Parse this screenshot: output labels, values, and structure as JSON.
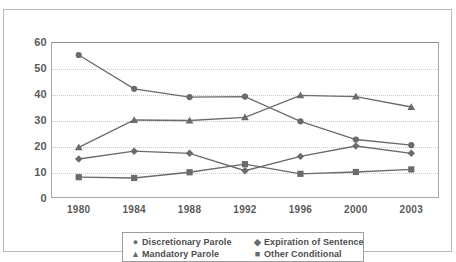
{
  "title_strip": "",
  "chart_data": {
    "type": "line",
    "title": "",
    "xlabel": "",
    "ylabel": "",
    "categories": [
      "1980",
      "1984",
      "1988",
      "1992",
      "1996",
      "2000",
      "2003"
    ],
    "ylim": [
      0,
      60
    ],
    "yticks": [
      0,
      10,
      20,
      30,
      40,
      50,
      60
    ],
    "grid": true,
    "legend_position": "bottom",
    "series": [
      {
        "name": "Discretionary Parole",
        "marker": "circle",
        "marker_glyph": "●",
        "color": "#6b6b6b",
        "values": [
          55,
          42,
          38.8,
          39,
          29.5,
          22.5,
          20.3
        ]
      },
      {
        "name": "Expiration of Sentence",
        "marker": "diamond",
        "marker_glyph": "◆",
        "color": "#6b6b6b",
        "values": [
          15,
          18,
          17.2,
          10.5,
          16,
          20,
          17.2
        ]
      },
      {
        "name": "Mandatory Parole",
        "marker": "triangle",
        "marker_glyph": "▲",
        "color": "#6b6b6b",
        "values": [
          19.5,
          30,
          29.8,
          31,
          39.5,
          39,
          35
        ]
      },
      {
        "name": "Other Conditional",
        "marker": "square",
        "marker_glyph": "■",
        "color": "#6b6b6b",
        "values": [
          8,
          7.7,
          9.9,
          13,
          9.3,
          10,
          11
        ]
      }
    ]
  },
  "colors": {
    "line": "#6b6b6b",
    "grid": "#c9c9c9",
    "axis": "#a8a8a8",
    "frame": "#b9b9b9",
    "text": "#5a5a5a"
  }
}
